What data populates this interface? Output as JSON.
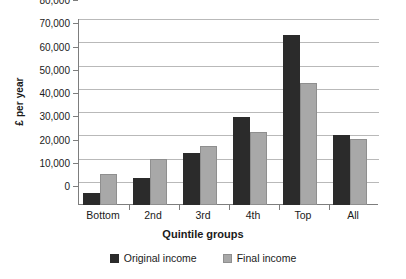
{
  "chart_data": {
    "type": "bar",
    "title": "",
    "xlabel": "Quintile groups",
    "ylabel": "£ per year",
    "categories": [
      "Bottom",
      "2nd",
      "3rd",
      "4th",
      "Top",
      "All"
    ],
    "series": [
      {
        "name": "Original income",
        "color": "#2b2b2b",
        "values": [
          5000,
          11500,
          22500,
          38000,
          73000,
          30000
        ]
      },
      {
        "name": "Final income",
        "color": "#a8a8a8",
        "values": [
          13500,
          19700,
          25500,
          31500,
          52500,
          28500
        ]
      }
    ],
    "ylim": [
      0,
      80000
    ],
    "ytick_values": [
      0,
      10000,
      20000,
      30000,
      40000,
      50000,
      60000,
      70000,
      80000
    ],
    "ytick_labels": [
      "0",
      "10,000",
      "20,000",
      "30,000",
      "40,000",
      "50,000",
      "60,000",
      "70,000",
      "80,000"
    ],
    "grid": true,
    "legend_position": "bottom"
  }
}
